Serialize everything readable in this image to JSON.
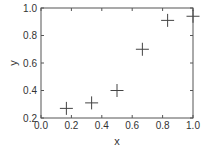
{
  "chart_data": {
    "type": "scatter",
    "title": "",
    "xlabel": "x",
    "ylabel": "y",
    "xlim": [
      0.0,
      1.0
    ],
    "ylim": [
      0.2,
      1.0
    ],
    "xticks": [
      0.0,
      0.2,
      0.4,
      0.6,
      0.8,
      1.0
    ],
    "yticks": [
      0.2,
      0.4,
      0.6,
      0.8,
      1.0
    ],
    "xtick_labels": [
      "0.0",
      "0.2",
      "0.4",
      "0.6",
      "0.8",
      "1.0"
    ],
    "ytick_labels": [
      "0.2",
      "0.4",
      "0.6",
      "0.8",
      "1.0"
    ],
    "grid": false,
    "legend": null,
    "marker": "plus",
    "series": [
      {
        "name": "data",
        "x": [
          0.167,
          0.333,
          0.5,
          0.667,
          0.833,
          1.0
        ],
        "y": [
          0.27,
          0.31,
          0.4,
          0.7,
          0.91,
          0.94
        ]
      }
    ]
  },
  "colors": {
    "axis": "#555555",
    "marker": "#444444",
    "text": "#333333",
    "background": "#ffffff"
  }
}
